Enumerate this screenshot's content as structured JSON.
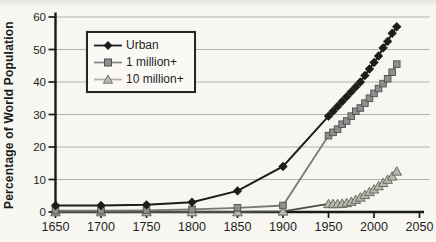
{
  "chart_data": {
    "type": "line",
    "title": "",
    "xlabel": "",
    "ylabel": "Percentage of World Population",
    "xlim": [
      1650,
      2050
    ],
    "ylim": [
      0,
      60
    ],
    "x_ticks": [
      1650,
      1700,
      1750,
      1800,
      1850,
      1900,
      1950,
      2000,
      2050
    ],
    "y_ticks": [
      0,
      10,
      20,
      30,
      40,
      50,
      60
    ],
    "grid": "horizontal",
    "legend_position": "upper-left-inside",
    "series": [
      {
        "name": "Urban",
        "marker": "diamond",
        "line_color": "#1c1c1c",
        "fill_color": "#1c1c1c",
        "edge_color": "#1c1c1c",
        "points": [
          [
            1650,
            2
          ],
          [
            1700,
            2
          ],
          [
            1750,
            2.2
          ],
          [
            1800,
            3
          ],
          [
            1850,
            6.5
          ],
          [
            1900,
            14
          ],
          [
            1950,
            29.5
          ],
          [
            1955,
            31
          ],
          [
            1960,
            32.5
          ],
          [
            1965,
            34
          ],
          [
            1970,
            35.5
          ],
          [
            1975,
            37
          ],
          [
            1980,
            38.5
          ],
          [
            1985,
            40
          ],
          [
            1990,
            42
          ],
          [
            1995,
            44
          ],
          [
            2000,
            46
          ],
          [
            2005,
            48
          ],
          [
            2010,
            50.5
          ],
          [
            2015,
            52.5
          ],
          [
            2020,
            55
          ],
          [
            2025,
            57
          ]
        ]
      },
      {
        "name": "1 million+",
        "marker": "square",
        "line_color": "#787878",
        "fill_color": "#8e8e8e",
        "edge_color": "#4f4f4f",
        "points": [
          [
            1650,
            0.4
          ],
          [
            1700,
            0.4
          ],
          [
            1750,
            0.5
          ],
          [
            1800,
            0.8
          ],
          [
            1850,
            1.3
          ],
          [
            1900,
            2
          ],
          [
            1950,
            23.5
          ],
          [
            1955,
            24.5
          ],
          [
            1960,
            25.5
          ],
          [
            1965,
            27
          ],
          [
            1970,
            28
          ],
          [
            1975,
            29.5
          ],
          [
            1980,
            31
          ],
          [
            1985,
            32
          ],
          [
            1990,
            33.5
          ],
          [
            1995,
            35
          ],
          [
            2000,
            36.5
          ],
          [
            2005,
            38
          ],
          [
            2010,
            39.5
          ],
          [
            2015,
            41
          ],
          [
            2020,
            43
          ],
          [
            2025,
            45.5
          ]
        ]
      },
      {
        "name": "10 million+",
        "marker": "triangle",
        "line_color": "#4c4b47",
        "fill_color": "#b9b8ae",
        "edge_color": "#6b6a62",
        "points": [
          [
            1650,
            0
          ],
          [
            1700,
            0
          ],
          [
            1750,
            0
          ],
          [
            1800,
            0
          ],
          [
            1850,
            0
          ],
          [
            1900,
            0.2
          ],
          [
            1950,
            2.5
          ],
          [
            1955,
            2.5
          ],
          [
            1960,
            2.5
          ],
          [
            1965,
            2.6
          ],
          [
            1970,
            2.8
          ],
          [
            1975,
            3.2
          ],
          [
            1980,
            3.8
          ],
          [
            1985,
            4.5
          ],
          [
            1990,
            5.3
          ],
          [
            1995,
            6.2
          ],
          [
            2000,
            7
          ],
          [
            2005,
            8
          ],
          [
            2010,
            9
          ],
          [
            2015,
            10
          ],
          [
            2020,
            11
          ],
          [
            2025,
            12.5
          ]
        ]
      }
    ],
    "axis_color": "#1a1a1a",
    "gridline_color": "#b3b1ac",
    "tick_label_color": "#1f1f1f"
  }
}
